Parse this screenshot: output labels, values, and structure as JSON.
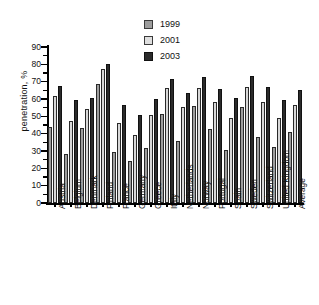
{
  "chart_data": {
    "type": "bar",
    "title": "",
    "xlabel": "",
    "ylabel": "penetration, %",
    "ylim": [
      0,
      90
    ],
    "ytick_step": 10,
    "grid": false,
    "legend_position": "top-center",
    "categories": [
      "Austria",
      "Belgium",
      "Denmark",
      "Finland",
      "France",
      "Germany",
      "Greece",
      "Italy",
      "Netherlands",
      "Norway",
      "Portugal",
      "Spain",
      "Sweden",
      "Switzerland",
      "United Kingdom",
      "Average"
    ],
    "ytick_labels": [
      "0",
      "10",
      "20",
      "30",
      "40",
      "50",
      "60",
      "70",
      "80",
      "90"
    ],
    "series": [
      {
        "name": "1999",
        "color": "#9d9d9d",
        "values": [
          44,
          28.5,
          43,
          68.5,
          29.5,
          24.5,
          32,
          51.5,
          35.5,
          56,
          42.5,
          30.5,
          55.5,
          38,
          32.5,
          41
        ]
      },
      {
        "name": "2001",
        "color": "#d8d8d8",
        "values": [
          62,
          47.5,
          54.5,
          77.5,
          46,
          39.5,
          51,
          66.5,
          55.5,
          66.5,
          58.5,
          49,
          67,
          58,
          49,
          56.5
        ]
      },
      {
        "name": "2003",
        "color": "#2b2b2b",
        "values": [
          67.5,
          59.5,
          60.5,
          80,
          56.5,
          51,
          60,
          71.5,
          63.5,
          72.5,
          65.5,
          60.5,
          73,
          67,
          59.5,
          65
        ]
      }
    ]
  },
  "legend": {
    "entries": [
      {
        "label": "1999",
        "swatch": "legend-swatch-1999"
      },
      {
        "label": "2001",
        "swatch": "legend-swatch-2001"
      },
      {
        "label": "2003",
        "swatch": "legend-swatch-2003"
      }
    ]
  }
}
